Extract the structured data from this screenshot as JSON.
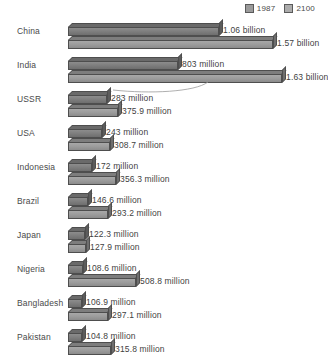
{
  "legend": {
    "items": [
      {
        "label": "1987",
        "color": "#9b9b9b",
        "swatch_name": "legend-swatch-1987"
      },
      {
        "label": "2100",
        "color": "#acacac",
        "swatch_name": "legend-swatch-2100"
      }
    ]
  },
  "chart_data": {
    "type": "bar",
    "orientation": "horizontal",
    "title": "",
    "subtitle": "",
    "xlabel": "",
    "ylabel": "",
    "grid": false,
    "legend_position": "top-right",
    "units": "people",
    "xlim": [
      0,
      1630
    ],
    "x_unit_note": "values in millions",
    "categories": [
      "China",
      "India",
      "USSR",
      "USA",
      "Indonesia",
      "Brazil",
      "Japan",
      "Nigeria",
      "Bangladesh",
      "Pakistan"
    ],
    "series": [
      {
        "name": "1987",
        "values": [
          1060,
          803,
          283,
          243,
          172,
          146.6,
          122.3,
          108.6,
          106.9,
          104.8
        ],
        "labels": [
          "1.06 billion",
          "803 million",
          "283 million",
          "243 million",
          "172 million",
          "146.6 million",
          "122.3 million",
          "108.6 million",
          "106.9 million",
          "104.8 million"
        ]
      },
      {
        "name": "2100",
        "values": [
          1570,
          1630,
          375.9,
          308.7,
          356.3,
          293.2,
          127.9,
          508.8,
          297.1,
          315.8
        ],
        "labels": [
          "1.57 billion",
          "1.63 billion",
          "375.9 million",
          "308.7 million",
          "356.3 million",
          "293.2 million",
          "127.9 million",
          "508.8 million",
          "297.1 million",
          "315.8 million"
        ]
      }
    ],
    "annotations": [
      {
        "name": "india-2100-leader-curve",
        "target": "India 2100 bar end",
        "shape": "curve"
      }
    ]
  },
  "rows": [
    {
      "country": "China",
      "v1987": "1.06 billion",
      "v2100": "1.57 billion",
      "w1987": 151,
      "w2100": 205,
      "lx1987": 155,
      "lx2100": 209
    },
    {
      "country": "India",
      "v1987": "803 million",
      "v2100": "1.63 billion",
      "w1987": 110,
      "w2100": 214,
      "lx1987": 114,
      "lx2100": 218
    },
    {
      "country": "USSR",
      "v1987": "283 million",
      "v2100": "375.9 million",
      "w1987": 39,
      "w2100": 50,
      "lx1987": 43,
      "lx2100": 54
    },
    {
      "country": "USA",
      "v1987": "243 million",
      "v2100": "308.7 million",
      "w1987": 34,
      "w2100": 42,
      "lx1987": 38,
      "lx2100": 46
    },
    {
      "country": "Indonesia",
      "v1987": "172 million",
      "v2100": "356.3 million",
      "w1987": 24,
      "w2100": 48,
      "lx1987": 28,
      "lx2100": 52
    },
    {
      "country": "Brazil",
      "v1987": "146.6 million",
      "v2100": "293.2 million",
      "w1987": 20,
      "w2100": 40,
      "lx1987": 24,
      "lx2100": 44
    },
    {
      "country": "Japan",
      "v1987": "122.3 million",
      "v2100": "127.9 million",
      "w1987": 17,
      "w2100": 18,
      "lx1987": 21,
      "lx2100": 22
    },
    {
      "country": "Nigeria",
      "v1987": "108.6 million",
      "v2100": "508.8 million",
      "w1987": 15,
      "w2100": 68,
      "lx1987": 19,
      "lx2100": 72
    },
    {
      "country": "Bangladesh",
      "v1987": "106.9 million",
      "v2100": "297.1 million",
      "w1987": 14,
      "w2100": 40,
      "lx1987": 18,
      "lx2100": 44
    },
    {
      "country": "Pakistan",
      "v1987": "104.8 million",
      "v2100": "315.8 million",
      "w1987": 14,
      "w2100": 43,
      "lx1987": 18,
      "lx2100": 47
    }
  ]
}
